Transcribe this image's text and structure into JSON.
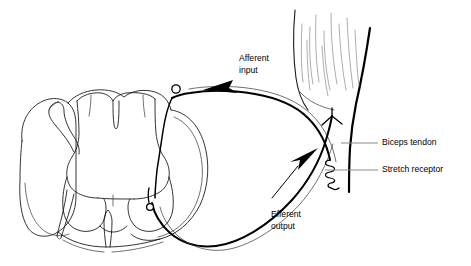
{
  "figure": {
    "background_color": "#ffffff",
    "width": 471,
    "height": 266
  },
  "labels": {
    "afferent": {
      "line1": "Afferent",
      "line2": "input",
      "x": 239,
      "y": 55,
      "color": "#000000"
    },
    "efferent": {
      "line1": "Efferent",
      "line2": "output",
      "x": 271,
      "y": 211,
      "color": "#000000"
    },
    "biceps_tendon": {
      "text": "Biceps tendon",
      "x": 382,
      "y": 143,
      "color": "#000000"
    },
    "stretch_receptor": {
      "text": "Stretch receptor",
      "x": 382,
      "y": 170,
      "color": "#000000"
    }
  },
  "leaders": {
    "biceps_tendon": {
      "x1": 341,
      "y1": 143,
      "x2": 378,
      "y2": 143,
      "color": "#8a8a8a"
    },
    "stretch_receptor": {
      "x1": 325,
      "y1": 170,
      "x2": 378,
      "y2": 170,
      "color": "#8a8a8a"
    }
  },
  "structures": {
    "spinal_cord": "white matter outline with butterfly gray matter",
    "dorsal_root_ganglion": "sensory neuron cell body circle",
    "ventral_horn_motoneuron": "motor neuron cell body",
    "muscle": "biceps muscle fibers",
    "tendon": "biceps tendon",
    "receptor": "muscle spindle stretch receptor coil"
  },
  "colors": {
    "outline": "#111111",
    "nerve": "#000000",
    "muscle_fiber": "#8a8a8a",
    "leader": "#8a8a8a",
    "text": "#000000"
  }
}
